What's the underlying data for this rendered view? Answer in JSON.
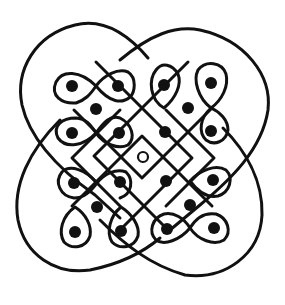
{
  "diagram": {
    "type": "kolam",
    "width": 285,
    "height": 305,
    "background": "#ffffff",
    "ink_color": "#111111",
    "center_dot": {
      "x": 143,
      "y": 157,
      "r": 5,
      "filled": false
    },
    "dot_radius": 6,
    "clusters": [
      {
        "name": "top-left",
        "dots": [
          [
            72,
            86
          ],
          [
            118,
            86
          ],
          [
            96,
            109
          ],
          [
            72,
            133
          ],
          [
            119,
            133
          ]
        ]
      },
      {
        "name": "top-right",
        "dots": [
          [
            164,
            85
          ],
          [
            211,
            83
          ],
          [
            188,
            108
          ],
          [
            165,
            132
          ],
          [
            211,
            131
          ]
        ]
      },
      {
        "name": "bottom-left",
        "dots": [
          [
            74,
            183
          ],
          [
            120,
            182
          ],
          [
            97,
            207
          ],
          [
            75,
            232
          ],
          [
            121,
            231
          ]
        ]
      },
      {
        "name": "bottom-right",
        "dots": [
          [
            166,
            181
          ],
          [
            213,
            180
          ],
          [
            190,
            205
          ],
          [
            167,
            229
          ],
          [
            214,
            228
          ]
        ]
      }
    ],
    "paths": [
      {
        "name": "outer-loop-top-left",
        "d": "M 148 58 C 120 25, 95 20, 75 25 C 35 35, 15 70, 22 105 C 30 140, 60 170, 95 195 L 120 218"
      },
      {
        "name": "outer-loop-top-right",
        "d": "M 120 60 C 150 35, 175 25, 200 30 C 245 40, 272 75, 268 110 C 262 150, 230 180, 200 205 L 170 230"
      },
      {
        "name": "outer-loop-bottom-left",
        "d": "M 60 120 C 30 150, 12 185, 18 220 C 25 255, 55 275, 90 270 C 115 265, 140 255, 160 238"
      },
      {
        "name": "outer-loop-bottom-right",
        "d": "M 100 220 C 125 245, 150 265, 185 275 C 225 280, 260 255, 262 215 C 263 180, 245 150, 223 128"
      },
      {
        "name": "tl-loop-a",
        "d": "M 96 86 C 80 70, 62 70, 56 82 C 50 96, 62 104, 76 103 C 85 100, 90 95, 96 86 C 104 75, 118 68, 128 72 C 137 78, 135 92, 130 97 C 122 104, 110 103, 96 86 Z"
      },
      {
        "name": "tl-loop-b",
        "d": "M 96 133 C 84 146, 66 149, 58 138 C 52 126, 62 118, 76 118 C 86 119, 90 124, 96 133 C 104 144, 118 150, 128 145 C 136 138, 132 124, 120 118 C 110 115, 104 122, 96 133 Z"
      },
      {
        "name": "tr-loop-a",
        "d": "M 164 108 C 150 100, 148 80, 156 70 C 162 62, 172 64, 178 74 C 182 84, 176 98, 164 108 Z"
      },
      {
        "name": "tr-loop-b",
        "d": "M 211 108 C 198 98, 193 80, 198 70 C 206 60, 222 62, 226 74 C 229 86, 222 100, 211 108 C 200 118, 198 132, 206 140 C 214 146, 226 142, 228 130 C 228 120, 220 112, 211 108 Z"
      },
      {
        "name": "bl-loop-a",
        "d": "M 97 183 C 86 170, 70 164, 62 172 C 54 182, 60 196, 74 198 C 84 198, 90 192, 97 183 C 104 174, 116 168, 126 172 C 134 180, 132 194, 120 198"
      },
      {
        "name": "bl-loop-b",
        "d": "M 75 207 C 62 216, 58 232, 64 242 C 72 250, 86 248, 90 236 C 92 226, 86 214, 75 207 Z"
      },
      {
        "name": "bl-loop-c",
        "d": "M 121 207 C 110 216, 106 232, 112 242 C 120 250, 134 248, 138 236 C 140 226, 132 214, 121 207 Z"
      },
      {
        "name": "br-loop-a",
        "d": "M 190 181 C 200 170, 216 164, 226 170 C 234 178, 230 192, 218 196 C 208 198, 198 192, 190 181 Z"
      },
      {
        "name": "br-loop-b",
        "d": "M 190 228 C 180 240, 164 246, 156 240 C 148 232, 152 218, 164 214 C 174 212, 184 218, 190 228 C 198 240, 214 246, 224 240 C 232 232, 228 218, 216 214 C 204 212, 196 218, 190 228 Z"
      },
      {
        "name": "diag-grid-1",
        "d": "M 96 62 L 192 158 L 120 230"
      },
      {
        "name": "diag-grid-2",
        "d": "M 188 62 L 94 156 L 166 228"
      },
      {
        "name": "diag-grid-3",
        "d": "M 120 110 L 72 158 L 120 206"
      },
      {
        "name": "diag-grid-4",
        "d": "M 166 110 L 214 158 L 166 206"
      },
      {
        "name": "diag-grid-5",
        "d": "M 74 110 L 142 178 L 212 108"
      },
      {
        "name": "diag-grid-6",
        "d": "M 72 206 L 142 136 L 212 206"
      }
    ]
  }
}
